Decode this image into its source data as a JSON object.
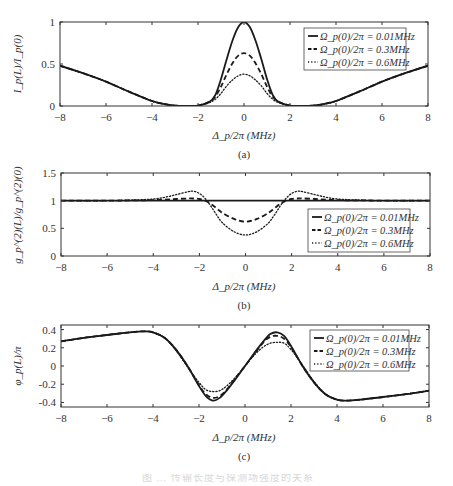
{
  "figure_caption": "图 … 传输长度与探测场强度的关系",
  "panels": [
    {
      "id": "a",
      "caption": "(a)",
      "ylabel": "I_p(L)/I_p(0)",
      "xlabel": "Δ_p/2π  (MHz)"
    },
    {
      "id": "b",
      "caption": "(b)",
      "ylabel": "g_p^(2)(L)/g_p^(2)(0)",
      "xlabel": "Δ_p/2π  (MHz)"
    },
    {
      "id": "c",
      "caption": "(c)",
      "ylabel": "φ_p(L)/π",
      "xlabel": "Δ_p/2π  (MHz)"
    }
  ],
  "legend": [
    {
      "label": "Ω_p(0)/2π = 0.01MHz",
      "style": "solid"
    },
    {
      "label": "Ω_p(0)/2π = 0.3MHz",
      "style": "dashed"
    },
    {
      "label": "Ω_p(0)/2π = 0.6MHz",
      "style": "dotted"
    }
  ],
  "chart_data": [
    {
      "type": "line",
      "title": "(a)",
      "xlabel": "Δp/2π (MHz)",
      "ylabel": "Ip(L)/Ip(0)",
      "xlim": [
        -8,
        8
      ],
      "ylim": [
        0,
        1
      ],
      "xticks": [
        -8,
        -6,
        -4,
        -2,
        0,
        2,
        4,
        6,
        8
      ],
      "yticks": [
        0,
        0.5,
        1
      ],
      "ytick_labels": [
        "0",
        "0.5",
        "1"
      ],
      "legend_position": "upper right",
      "grid": false,
      "x": [
        -8,
        -7,
        -6,
        -5,
        -4,
        -3.5,
        -3,
        -2.5,
        -2,
        -1.5,
        -1.25,
        -1,
        -0.75,
        -0.5,
        -0.25,
        0,
        0.25,
        0.5,
        0.75,
        1,
        1.25,
        1.5,
        2,
        2.5,
        3,
        3.5,
        4,
        5,
        6,
        7,
        8
      ],
      "series": [
        {
          "name": "Ωp(0)/2π = 0.01MHz",
          "style": "solid",
          "values": [
            0.48,
            0.39,
            0.29,
            0.17,
            0.06,
            0.025,
            0.005,
            0.002,
            0.005,
            0.05,
            0.13,
            0.32,
            0.56,
            0.78,
            0.94,
            1.0,
            0.94,
            0.78,
            0.56,
            0.32,
            0.13,
            0.05,
            0.005,
            0.002,
            0.005,
            0.025,
            0.06,
            0.17,
            0.29,
            0.39,
            0.48
          ]
        },
        {
          "name": "Ωp(0)/2π = 0.3MHz",
          "style": "dashed",
          "values": [
            0.48,
            0.39,
            0.29,
            0.17,
            0.06,
            0.025,
            0.005,
            0.002,
            0.005,
            0.05,
            0.11,
            0.23,
            0.38,
            0.51,
            0.6,
            0.63,
            0.6,
            0.51,
            0.38,
            0.23,
            0.11,
            0.05,
            0.005,
            0.002,
            0.005,
            0.025,
            0.06,
            0.17,
            0.29,
            0.39,
            0.48
          ]
        },
        {
          "name": "Ωp(0)/2π = 0.6MHz",
          "style": "dotted",
          "values": [
            0.48,
            0.39,
            0.29,
            0.17,
            0.06,
            0.025,
            0.005,
            0.002,
            0.005,
            0.04,
            0.08,
            0.15,
            0.24,
            0.31,
            0.36,
            0.38,
            0.36,
            0.31,
            0.24,
            0.15,
            0.08,
            0.04,
            0.005,
            0.002,
            0.005,
            0.025,
            0.06,
            0.17,
            0.29,
            0.39,
            0.48
          ]
        }
      ]
    },
    {
      "type": "line",
      "title": "(b)",
      "xlabel": "Δp/2π (MHz)",
      "ylabel": "gp(2)(L)/gp(2)(0)",
      "xlim": [
        -8,
        8
      ],
      "ylim": [
        0,
        1.5
      ],
      "xticks": [
        -8,
        -6,
        -4,
        -2,
        0,
        2,
        4,
        6,
        8
      ],
      "yticks": [
        0,
        0.5,
        1,
        1.5
      ],
      "ytick_labels": [
        "0",
        "0.5",
        "1",
        "1.5"
      ],
      "legend_position": "lower right",
      "grid": false,
      "x": [
        -8,
        -6,
        -5,
        -4,
        -3.5,
        -3,
        -2.5,
        -2.25,
        -2,
        -1.75,
        -1.5,
        -1.25,
        -1,
        -0.5,
        0,
        0.5,
        1,
        1.25,
        1.5,
        1.75,
        2,
        2.25,
        2.5,
        3,
        3.5,
        4,
        5,
        6,
        8
      ],
      "series": [
        {
          "name": "Ωp(0)/2π = 0.01MHz",
          "style": "solid",
          "values": [
            1,
            1,
            1,
            1,
            1,
            1,
            1,
            1,
            1,
            1,
            1,
            1,
            1,
            1,
            1,
            1,
            1,
            1,
            1,
            1,
            1,
            1,
            1,
            1,
            1,
            1,
            1,
            1,
            1
          ]
        },
        {
          "name": "Ωp(0)/2π = 0.3MHz",
          "style": "dashed",
          "values": [
            1,
            1,
            1.005,
            1.01,
            1.02,
            1.03,
            1.04,
            1.04,
            1.03,
            1.0,
            0.94,
            0.86,
            0.78,
            0.67,
            0.62,
            0.67,
            0.78,
            0.86,
            0.94,
            1.0,
            1.03,
            1.04,
            1.04,
            1.03,
            1.02,
            1.01,
            1.005,
            1,
            1
          ]
        },
        {
          "name": "Ωp(0)/2π = 0.6MHz",
          "style": "dotted",
          "values": [
            1,
            1,
            1.01,
            1.03,
            1.06,
            1.11,
            1.16,
            1.17,
            1.13,
            1.04,
            0.9,
            0.74,
            0.6,
            0.44,
            0.38,
            0.44,
            0.6,
            0.74,
            0.9,
            1.04,
            1.13,
            1.17,
            1.16,
            1.11,
            1.06,
            1.03,
            1.01,
            1,
            1
          ]
        }
      ]
    },
    {
      "type": "line",
      "title": "(c)",
      "xlabel": "Δp/2π (MHz)",
      "ylabel": "φp(L)/π",
      "xlim": [
        -8,
        8
      ],
      "ylim": [
        -0.45,
        0.45
      ],
      "xticks": [
        -8,
        -6,
        -4,
        -2,
        0,
        2,
        4,
        6,
        8
      ],
      "yticks": [
        -0.4,
        -0.2,
        0,
        0.2,
        0.4
      ],
      "ytick_labels": [
        "-0.4",
        "-0.2",
        "0",
        "0.2",
        "0.4"
      ],
      "legend_position": "upper right",
      "grid": false,
      "x": [
        -8,
        -7,
        -6,
        -5,
        -4.4,
        -4,
        -3.5,
        -3,
        -2.5,
        -2,
        -1.7,
        -1.4,
        -1.1,
        -0.8,
        -0.4,
        0,
        0.4,
        0.8,
        1.1,
        1.4,
        1.7,
        2,
        2.5,
        3,
        3.5,
        4,
        4.4,
        5,
        6,
        7,
        8
      ],
      "series": [
        {
          "name": "Ωp(0)/2π = 0.01MHz",
          "style": "solid",
          "values": [
            0.27,
            0.31,
            0.34,
            0.37,
            0.38,
            0.37,
            0.31,
            0.18,
            0.0,
            -0.22,
            -0.33,
            -0.38,
            -0.35,
            -0.27,
            -0.14,
            0.0,
            0.14,
            0.27,
            0.35,
            0.37,
            0.33,
            0.22,
            0.0,
            -0.18,
            -0.31,
            -0.37,
            -0.38,
            -0.37,
            -0.34,
            -0.31,
            -0.27
          ]
        },
        {
          "name": "Ωp(0)/2π = 0.3MHz",
          "style": "dashed",
          "values": [
            0.27,
            0.31,
            0.34,
            0.37,
            0.38,
            0.37,
            0.31,
            0.18,
            0.0,
            -0.21,
            -0.31,
            -0.35,
            -0.33,
            -0.26,
            -0.13,
            0.0,
            0.13,
            0.26,
            0.32,
            0.33,
            0.3,
            0.21,
            0.0,
            -0.18,
            -0.31,
            -0.37,
            -0.38,
            -0.37,
            -0.34,
            -0.31,
            -0.27
          ]
        },
        {
          "name": "Ωp(0)/2π = 0.6MHz",
          "style": "dotted",
          "values": [
            0.27,
            0.31,
            0.34,
            0.37,
            0.38,
            0.37,
            0.31,
            0.17,
            -0.01,
            -0.18,
            -0.26,
            -0.28,
            -0.27,
            -0.22,
            -0.12,
            0.0,
            0.12,
            0.21,
            0.25,
            0.26,
            0.25,
            0.18,
            0.01,
            -0.17,
            -0.31,
            -0.37,
            -0.38,
            -0.37,
            -0.34,
            -0.31,
            -0.27
          ]
        }
      ]
    }
  ]
}
